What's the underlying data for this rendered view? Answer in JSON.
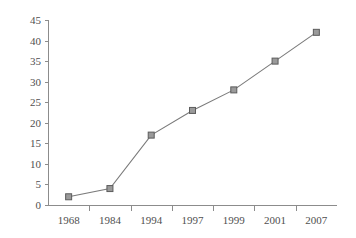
{
  "chart_data": {
    "type": "line",
    "title": "",
    "xlabel": "",
    "ylabel": "",
    "categories": [
      "1968",
      "1984",
      "1994",
      "1997",
      "1999",
      "2001",
      "2007"
    ],
    "values": [
      2,
      4,
      17,
      23,
      28,
      35,
      42
    ],
    "series": [
      {
        "name": "",
        "values": [
          2,
          4,
          17,
          23,
          28,
          35,
          42
        ]
      }
    ],
    "ylim": [
      0,
      45
    ],
    "ytick_step": 5,
    "y_ticks": [
      "0",
      "5",
      "10",
      "15",
      "20",
      "25",
      "30",
      "35",
      "40",
      "45"
    ],
    "x_ticks": [
      "1968",
      "1984",
      "1994",
      "1997",
      "1999",
      "2001",
      "2007"
    ],
    "grid": false,
    "legend": null,
    "legend_position": "none",
    "marker": "square",
    "colors": {
      "line": "#7a7a7a",
      "marker_fill": "#9a9a9a",
      "marker_stroke": "#5c5c5c",
      "axis": "#8c8c8c",
      "tick_text": "#4f4f4f",
      "background": "#ffffff"
    }
  }
}
